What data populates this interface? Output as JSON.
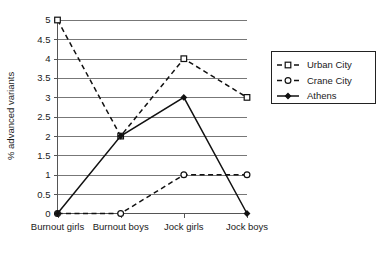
{
  "chart_data": {
    "type": "line",
    "title": "",
    "xlabel": "",
    "ylabel": "% advanced variants",
    "categories": [
      "Burnout girls",
      "Burnout boys",
      "Jock girls",
      "Jock boys"
    ],
    "ylim": [
      0,
      5
    ],
    "ytick_step": 0.5,
    "ytick_labels": [
      "0",
      "0.5",
      "1",
      "1.5",
      "2",
      "2.5",
      "3",
      "3.5",
      "4",
      "4.5",
      "5"
    ],
    "ytick_values": [
      0,
      0.5,
      1,
      1.5,
      2,
      2.5,
      3,
      3.5,
      4,
      4.5,
      5
    ],
    "grid": true,
    "grid_axis": "y",
    "legend_position": "right",
    "series": [
      {
        "name": "Urban City",
        "values": [
          5,
          2,
          4,
          3
        ],
        "line_style": "dashed",
        "marker": "open-square",
        "color": "#111111"
      },
      {
        "name": "Crane City",
        "values": [
          0,
          0,
          1,
          1
        ],
        "line_style": "dashed",
        "marker": "open-circle",
        "color": "#111111"
      },
      {
        "name": "Athens",
        "values": [
          0,
          2,
          3,
          0
        ],
        "line_style": "solid",
        "marker": "filled-diamond",
        "color": "#111111"
      }
    ]
  },
  "axes": {
    "y_title": "% advanced variants"
  },
  "legend": {
    "entries": [
      {
        "label": "Urban City"
      },
      {
        "label": "Crane City"
      },
      {
        "label": "Athens"
      }
    ]
  }
}
